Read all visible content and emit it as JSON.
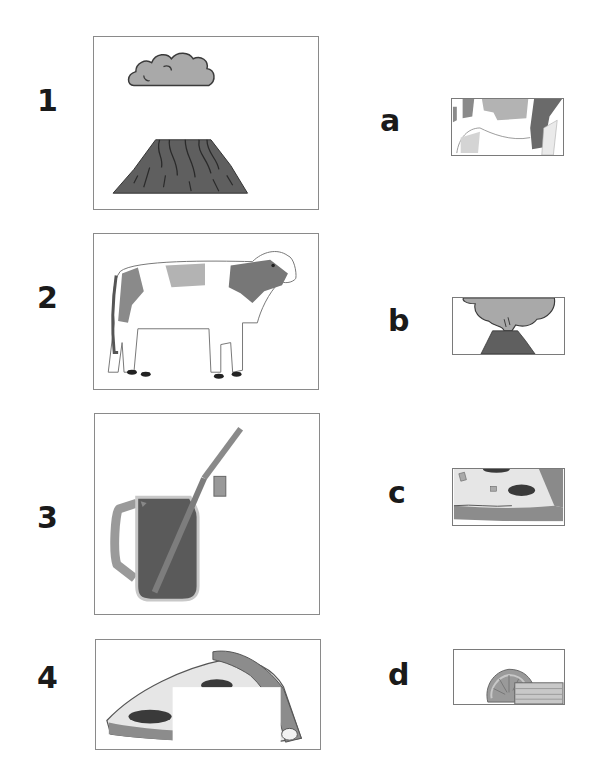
{
  "worksheet": {
    "left_items": [
      {
        "label": "1",
        "image": "volcano-with-ash-cloud"
      },
      {
        "label": "2",
        "image": "cow"
      },
      {
        "label": "3",
        "image": "jar-drink-with-straw"
      },
      {
        "label": "4",
        "image": "pizza-slice"
      }
    ],
    "right_items": [
      {
        "label": "a",
        "image": "cow-detail-crop"
      },
      {
        "label": "b",
        "image": "volcano-detail-crop"
      },
      {
        "label": "c",
        "image": "pizza-detail-crop"
      },
      {
        "label": "d",
        "image": "drink-lemon-detail-crop"
      }
    ]
  },
  "colors": {
    "ink": "#1a1a1a",
    "dark_gray": "#5a5a5a",
    "mid_gray": "#8c8c8c",
    "light_gray": "#b5b5b5",
    "frame_border": "#8a8a8a"
  }
}
